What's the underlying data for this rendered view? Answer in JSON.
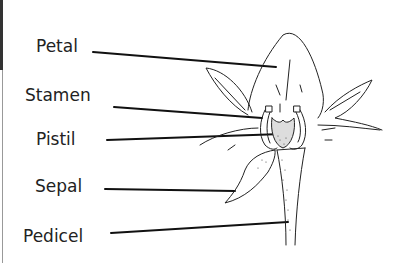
{
  "diagram": {
    "type": "labeled botanical illustration",
    "labels": [
      {
        "id": "petal",
        "text": "Petal"
      },
      {
        "id": "stamen",
        "text": "Stamen"
      },
      {
        "id": "pistil",
        "text": "Pistil"
      },
      {
        "id": "sepal",
        "text": "Sepal"
      },
      {
        "id": "pedicel",
        "text": "Pedicel"
      }
    ]
  }
}
